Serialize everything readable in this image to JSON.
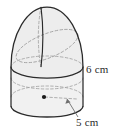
{
  "figure": {
    "name": "cylinder-with-hemisphere-top",
    "labels": {
      "height": "6 cm",
      "radius": "5 cm"
    },
    "colors": {
      "outline": "#2b2b2b",
      "fill": "#f0f0f0",
      "fill_dome": "#ededed",
      "hidden_line": "#9a9a9a",
      "center_dot": "#1a1a1a",
      "leader_line": "#6f6f6f",
      "text": "#2b2b2b",
      "background": "#ffffff"
    },
    "geometry": {
      "cylinder_left_x": 11,
      "cylinder_right_x": 83,
      "cylinder_top_y": 56,
      "cylinder_bottom_y": 106,
      "ellipse_rx": 36,
      "ellipse_ry": 11,
      "dome_top_y": 7,
      "center_dot_x": 44,
      "center_dot_y": 97,
      "meridian_x": 41
    },
    "annotations": {
      "height_dimension": "vertical extent of cylinder body labeled 6 cm",
      "radius_dimension": "dashed radius arrow from center dot to rim labeled 5 cm"
    }
  }
}
